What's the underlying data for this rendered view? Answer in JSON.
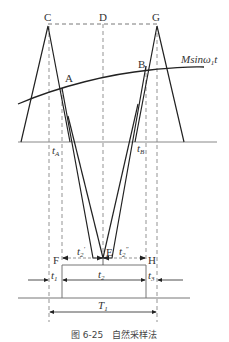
{
  "diagram": {
    "points": {
      "C": "C",
      "D": "D",
      "G": "G",
      "A": "A",
      "B": "B",
      "E": "E",
      "F": "F",
      "H": "H"
    },
    "curve_label": {
      "main": "Msin",
      "omega": "ω",
      "sub": "1",
      "t": "t"
    },
    "axis_labels": {
      "tA": "t",
      "tA_sub": "A",
      "tB": "t",
      "tB_sub": "B"
    },
    "intervals": {
      "t2_prime": "t",
      "t2_prime_sub": "2",
      "t2_prime_sup": "′",
      "t2_dprime": "t",
      "t2_dprime_sub": "2",
      "t2_dprime_sup": "″",
      "t1": "t",
      "t1_sub": "1",
      "t2": "t",
      "t2_sub": "2",
      "t3": "t",
      "t3_sub": "3",
      "T1": "T",
      "T1_sub": "1"
    },
    "caption": "图 6-25　自然采样法"
  }
}
